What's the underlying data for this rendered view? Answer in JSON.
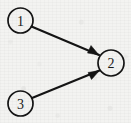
{
  "diagram": {
    "type": "directed-graph",
    "width": 131,
    "height": 123,
    "background_color": "#f3f3f1",
    "ink_color": "#141414",
    "nodes": [
      {
        "id": "1",
        "label": "1",
        "cx": 20.5,
        "cy": 20.5,
        "r": 12.5
      },
      {
        "id": "2",
        "label": "2",
        "cx": 111.0,
        "cy": 63.0,
        "r": 13.0
      },
      {
        "id": "3",
        "label": "3",
        "cx": 20.5,
        "cy": 103.5,
        "r": 12.5
      }
    ],
    "edges": [
      {
        "id": "edge-1-2",
        "from": "1",
        "to": "2",
        "directed": true,
        "x1": 31.5,
        "y1": 26.5,
        "x2": 99.0,
        "y2": 55.0,
        "arrowhead": "99.0,55.0 87.5,53.0 91.0,45.5"
      },
      {
        "id": "edge-3-2",
        "from": "3",
        "to": "2",
        "directed": true,
        "x1": 32.0,
        "y1": 98.0,
        "x2": 99.5,
        "y2": 70.5,
        "arrowhead": "99.5,70.5 88.0,72.5 91.5,79.5"
      }
    ]
  }
}
